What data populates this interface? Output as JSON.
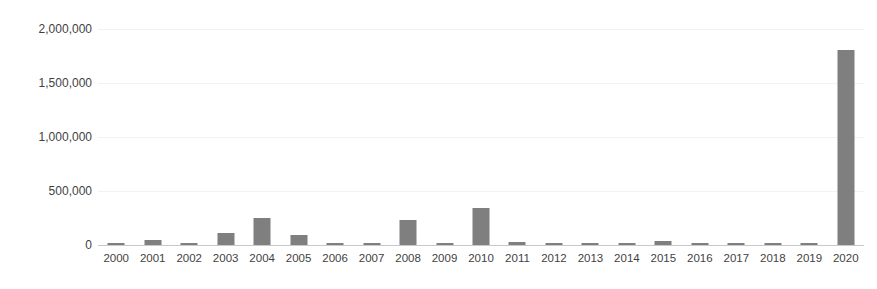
{
  "chart_data": {
    "type": "bar",
    "title": "",
    "subtitle": "",
    "xlabel": "",
    "ylabel": "",
    "categories": [
      "2000",
      "2001",
      "2002",
      "2003",
      "2004",
      "2005",
      "2006",
      "2007",
      "2008",
      "2009",
      "2010",
      "2011",
      "2012",
      "2013",
      "2014",
      "2015",
      "2016",
      "2017",
      "2018",
      "2019",
      "2020"
    ],
    "values": [
      14000,
      45000,
      20000,
      110000,
      250000,
      90000,
      22000,
      12000,
      230000,
      18000,
      340000,
      30000,
      8000,
      20000,
      22000,
      34000,
      14000,
      13000,
      9000,
      20000,
      1810000
    ],
    "series": [
      {
        "name": "",
        "values": [
          14000,
          45000,
          20000,
          110000,
          250000,
          90000,
          22000,
          12000,
          230000,
          18000,
          340000,
          30000,
          8000,
          20000,
          22000,
          34000,
          14000,
          13000,
          9000,
          20000,
          1810000
        ]
      }
    ],
    "ylim": [
      0,
      2000000
    ],
    "ytick_values": [
      0,
      500000,
      1000000,
      1500000,
      2000000
    ],
    "ytick_labels": [
      "0",
      "500,000",
      "1,000,000",
      "1,500,000",
      "2,000,000"
    ],
    "grid": true,
    "grid_axis": "y",
    "legend": false,
    "legend_position": "none",
    "bar_color": "#7f7f7f",
    "gridline_color": "#f2f2f4",
    "axis_color": "#c8c8cc",
    "tick_label_color": "#3f3f3f",
    "annotations": []
  },
  "figure": {
    "clipped_title_text": "··················································",
    "background_color": "#ffffff"
  }
}
